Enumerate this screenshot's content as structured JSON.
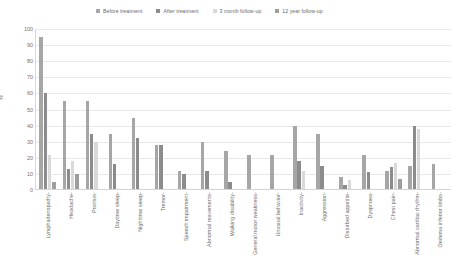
{
  "chart_data": {
    "type": "bar",
    "title": "",
    "xlabel": "",
    "ylabel": "%",
    "ylim": [
      0,
      100
    ],
    "yticks": [
      0,
      10,
      20,
      30,
      40,
      50,
      60,
      70,
      80,
      90,
      100
    ],
    "grid": true,
    "legend_position": "top",
    "categories": [
      "Lymphadenopathy",
      "Headache",
      "Pruritus",
      "Daytime sleep",
      "Nighttime sleep",
      "Tremor",
      "Speech impairment",
      "Abnormal movements",
      "Walking disability",
      "General motor weakness",
      "Unusual behavior",
      "Inactivity",
      "Aggression",
      "Disturbed appetite",
      "Dyspnoea",
      "Chest pain",
      "Abnormal cardiac rhythm",
      "Oedema inferior limbs"
    ],
    "series": [
      {
        "name": "Before treatment",
        "color": "#a6a6a6",
        "values": [
          95,
          55,
          55,
          35,
          45,
          28,
          12,
          30,
          24,
          22,
          22,
          40,
          35,
          8,
          22,
          12,
          15,
          16
        ]
      },
      {
        "name": "After treatment",
        "color": "#8c8c8c",
        "values": [
          60,
          13,
          35,
          16,
          32,
          28,
          10,
          12,
          5,
          0,
          0,
          18,
          15,
          3,
          11,
          14,
          40,
          0
        ]
      },
      {
        "name": "3 month follow-up",
        "color": "#d9d9d9",
        "values": [
          22,
          18,
          30,
          0,
          0,
          0,
          0,
          0,
          0,
          0,
          0,
          12,
          0,
          6,
          0,
          17,
          38,
          0
        ]
      },
      {
        "name": "12 year follow-up",
        "color": "#9e9e9e",
        "values": [
          5,
          10,
          0,
          0,
          0,
          0,
          0,
          0,
          0,
          0,
          0,
          0,
          0,
          0,
          0,
          7,
          0,
          0
        ]
      }
    ]
  },
  "legend": {
    "items": [
      {
        "label": "Before treatment"
      },
      {
        "label": "After treatment"
      },
      {
        "label": "3 month follow-up"
      },
      {
        "label": "12 year follow-up"
      }
    ]
  },
  "axes": {
    "y_title": "%"
  }
}
